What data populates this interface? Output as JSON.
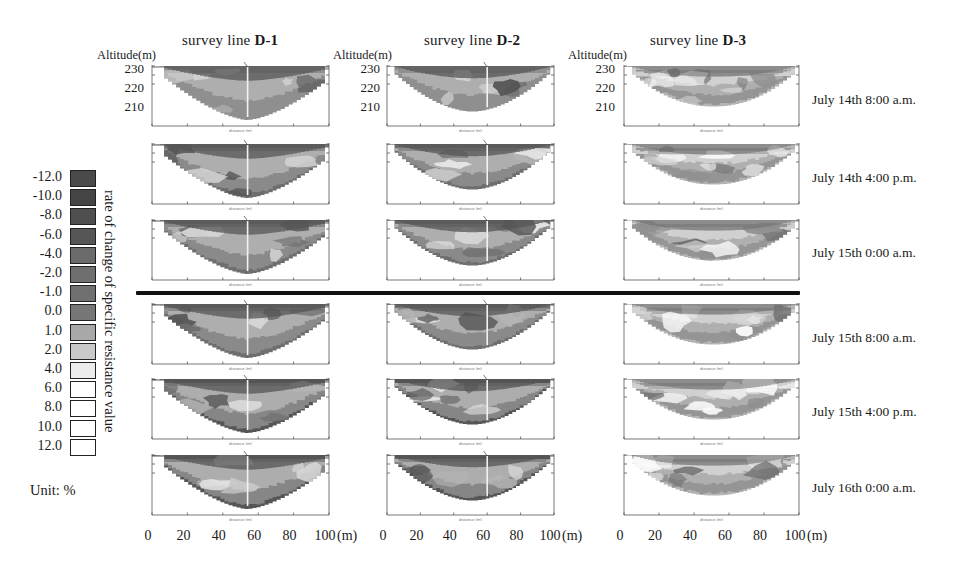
{
  "figure": {
    "altitude_caption": "Altitude(m)",
    "altitude_ticks": [
      "230",
      "220",
      "210"
    ],
    "borehole_d1": "No.4",
    "borehole_d2": "No.5",
    "x_unit": "(m)"
  },
  "columns": [
    {
      "prefix": "survey line ",
      "name": "D-1"
    },
    {
      "prefix": "survey line ",
      "name": "D-2"
    },
    {
      "prefix": "survey line ",
      "name": "D-3"
    }
  ],
  "rows": [
    {
      "date": "July 14th 8:00 a.m."
    },
    {
      "date": "July 14th 4:00 p.m."
    },
    {
      "date": "July 15th 0:00 a.m."
    },
    {
      "date": "July 15th 8:00 a.m."
    },
    {
      "date": "July 15th 4:00 p.m."
    },
    {
      "date": "July 16th 0:00 a.m."
    }
  ],
  "legend": {
    "title": "rate of change of specific resistance value",
    "unit": "Unit: %",
    "labels": [
      "-12.0",
      "-10.0",
      "-8.0",
      "-6.0",
      "-4.0",
      "-2.0",
      "-1.0",
      "0.0",
      "1.0",
      "2.0",
      "4.0",
      "6.0",
      "8.0",
      "10.0",
      "12.0"
    ],
    "colors": [
      "#4a4a4a",
      "#454545",
      "#4f4f4f",
      "#565656",
      "#6b6b6b",
      "#6f6f6f",
      "#707070",
      "#767676",
      "#a8a8a8",
      "#c9c9c9",
      "#ececec",
      "#ffffff",
      "#ffffff",
      "#ffffff",
      "#ffffff",
      "#ffffff"
    ]
  },
  "chart_data": {
    "type": "heatmap",
    "xlabel": "distance (m)",
    "ylabel": "Altitude (m)",
    "xlim": [
      0,
      100
    ],
    "ylim": [
      205,
      232
    ],
    "xticks": [
      0,
      20,
      40,
      60,
      80,
      100
    ],
    "yticks": [
      230,
      220,
      210
    ],
    "unit": "%",
    "colorbar_levels": [
      -12.0,
      -10.0,
      -8.0,
      -6.0,
      -4.0,
      -2.0,
      -1.0,
      0.0,
      1.0,
      2.0,
      4.0,
      6.0,
      8.0,
      10.0,
      12.0
    ],
    "grid": false,
    "legend_position": "left",
    "panel_rows": [
      "July 14th 8:00 a.m.",
      "July 14th 4:00 p.m.",
      "July 15th 0:00 a.m.",
      "July 15th 8:00 a.m.",
      "July 15th 4:00 p.m.",
      "July 16th 0:00 a.m."
    ],
    "panel_cols": [
      "D-1",
      "D-2",
      "D-3"
    ],
    "boreholes": {
      "D-1": {
        "label": "No.4",
        "x": 54
      },
      "D-2": {
        "label": "No.5",
        "x": 60
      }
    }
  }
}
